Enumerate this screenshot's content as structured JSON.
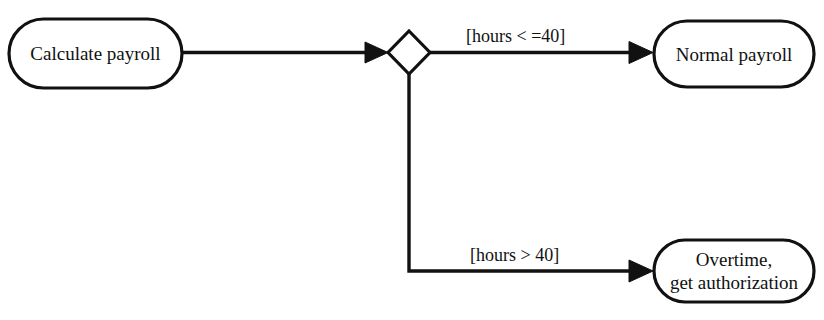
{
  "diagram": {
    "type": "uml-activity-diagram",
    "background_color": "#ffffff",
    "stroke_color": "#111111",
    "nodes": [
      {
        "id": "calculate-payroll",
        "shape": "rounded-rectangle",
        "label": "Calculate payroll"
      },
      {
        "id": "decision",
        "shape": "diamond",
        "label": ""
      },
      {
        "id": "normal-payroll",
        "shape": "rounded-rectangle",
        "label": "Normal payroll"
      },
      {
        "id": "overtime",
        "shape": "rounded-rectangle",
        "label_line_1": "Overtime,",
        "label_line_2": "get authorization"
      }
    ],
    "guards": {
      "top": "[hours < =40]",
      "bottom": "[hours > 40]"
    }
  }
}
